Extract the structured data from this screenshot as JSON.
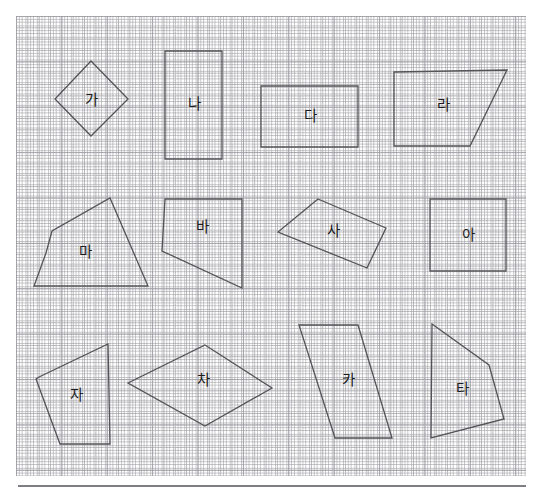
{
  "worksheet": {
    "title": "Polygon shapes on grid paper worksheet",
    "grid": {
      "minor_cell_px": 11.35,
      "major_cell_px": 45.4,
      "minor_color": "#a8a8af",
      "major_color": "#989898",
      "paper_color": "#ffffff"
    },
    "shape_stroke_color": "#545458",
    "label_color": "#1c1c1e",
    "footer_rule_color": "#7e7e86"
  },
  "shapes": [
    {
      "id": "ga",
      "label": "가",
      "kind": "quadrilateral-diamond",
      "points": "91,61 128,99 91,136 55,99",
      "label_x": 91,
      "label_y": 101
    },
    {
      "id": "na",
      "label": "나",
      "kind": "rectangle",
      "points": "165,51 222,51 222,159 165,159",
      "label_x": 194,
      "label_y": 105
    },
    {
      "id": "da",
      "label": "다",
      "kind": "rectangle",
      "points": "261,86 358,86 358,147 261,147",
      "label_x": 310,
      "label_y": 117
    },
    {
      "id": "ra",
      "label": "라",
      "kind": "trapezoid",
      "points": "394,72 507,70 470,146 394,146",
      "label_x": 443,
      "label_y": 106
    },
    {
      "id": "ma",
      "label": "마",
      "kind": "pentagon",
      "points": "110,198 148,286 34,286 46,253 52,231",
      "label_x": 85,
      "label_y": 253
    },
    {
      "id": "ba",
      "label": "바",
      "kind": "pentagon",
      "points": "165,199 242,199 242,288 162,251 165,199",
      "label_x": 202,
      "label_y": 228
    },
    {
      "id": "sa",
      "label": "사",
      "kind": "quadrilateral",
      "points": "318,199 386,228 367,268 278,232",
      "label_x": 333,
      "label_y": 232
    },
    {
      "id": "a",
      "label": "아",
      "kind": "square",
      "points": "430,199 506,199 506,271 430,271",
      "label_x": 468,
      "label_y": 236
    },
    {
      "id": "ja",
      "label": "자",
      "kind": "pentagon",
      "points": "108,344 110,444 60,444 36,379 39,377",
      "label_x": 76,
      "label_y": 396
    },
    {
      "id": "cha",
      "label": "차",
      "kind": "rhombus",
      "points": "205,345 272,388 205,426 128,383",
      "label_x": 203,
      "label_y": 381
    },
    {
      "id": "ka",
      "label": "카",
      "kind": "parallelogram",
      "points": "299,325 358,325 392,438 335,438",
      "label_x": 348,
      "label_y": 381
    },
    {
      "id": "ta",
      "label": "타",
      "kind": "quadrilateral",
      "points": "432,324 489,365 504,419 431,438",
      "label_x": 462,
      "label_y": 390
    }
  ]
}
